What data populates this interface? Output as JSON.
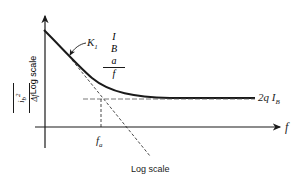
{
  "diagram": {
    "title": "",
    "y_axis": {
      "quantity_numerator": "i",
      "quantity_numerator_sub": "b",
      "quantity_numerator_sup": "2",
      "quantity_denominator": "Δf",
      "scale_label": "Log scale"
    },
    "x_axis": {
      "label": "f",
      "scale_label": "Log scale",
      "corner_frequency_label": "f",
      "corner_frequency_sub": "a"
    },
    "curve_label": {
      "coefficient": "K",
      "coefficient_sub": "1",
      "numerator": "I",
      "numerator_sub": "B",
      "numerator_sup": "a",
      "denominator": "f"
    },
    "asymptote_label": {
      "prefix": "2q I",
      "sub": "B"
    },
    "colors": {
      "line": "#1a1a1a",
      "background": "#ffffff"
    }
  }
}
